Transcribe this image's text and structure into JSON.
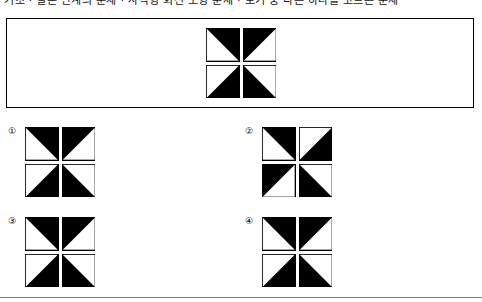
{
  "page": {
    "header_text": "기초 · 결론 단계의 문제 · 사각형 회전 도형 문제 · 보기 중 다른 하나를 고르는 문제",
    "stimulus_label": "stimulus-figure"
  },
  "colors": {
    "ink": "#000000",
    "paper": "#ffffff",
    "rule": "#7d7d7d"
  },
  "stimulus": {
    "name": "pinwheel-figure",
    "quadrants": [
      {
        "position": "top-left",
        "filled_triangle": "upper-right"
      },
      {
        "position": "top-right",
        "filled_triangle": "upper-left"
      },
      {
        "position": "bottom-left",
        "filled_triangle": "lower-right"
      },
      {
        "position": "bottom-right",
        "filled_triangle": "lower-left"
      }
    ]
  },
  "options": [
    {
      "number": "①",
      "name": "option-1",
      "quadrants": [
        {
          "position": "top-left",
          "filled_triangle": "upper-right"
        },
        {
          "position": "top-right",
          "filled_triangle": "upper-left"
        },
        {
          "position": "bottom-left",
          "filled_triangle": "lower-right"
        },
        {
          "position": "bottom-right",
          "filled_triangle": "lower-left"
        }
      ]
    },
    {
      "number": "②",
      "name": "option-2",
      "quadrants": [
        {
          "position": "top-left",
          "filled_triangle": "upper-right"
        },
        {
          "position": "top-right",
          "filled_triangle": "lower-right"
        },
        {
          "position": "bottom-left",
          "filled_triangle": "upper-left"
        },
        {
          "position": "bottom-right",
          "filled_triangle": "lower-left"
        }
      ]
    },
    {
      "number": "③",
      "name": "option-3",
      "quadrants": [
        {
          "position": "top-left",
          "filled_triangle": "upper-right"
        },
        {
          "position": "top-right",
          "filled_triangle": "upper-left"
        },
        {
          "position": "bottom-left",
          "filled_triangle": "lower-right"
        },
        {
          "position": "bottom-right",
          "filled_triangle": "lower-left"
        }
      ]
    },
    {
      "number": "④",
      "name": "option-4",
      "quadrants": [
        {
          "position": "top-left",
          "filled_triangle": "upper-right"
        },
        {
          "position": "top-right",
          "filled_triangle": "upper-left"
        },
        {
          "position": "bottom-left",
          "filled_triangle": "lower-right"
        },
        {
          "position": "bottom-right",
          "filled_triangle": "lower-left"
        }
      ]
    }
  ]
}
